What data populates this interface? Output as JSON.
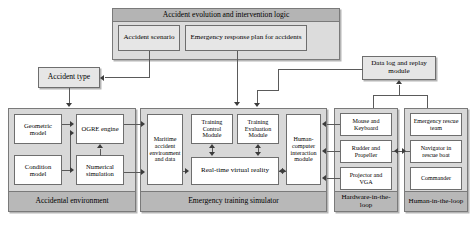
{
  "diagram": {
    "type": "block-diagram",
    "top_container": {
      "header_label": "Accident evolution and intervention logic",
      "children": [
        {
          "label": "Accident scenario"
        },
        {
          "label": "Emergency response plan for accidents"
        }
      ]
    },
    "standalone_nodes": [
      {
        "label": "Accident type"
      },
      {
        "label": "Data log and replay module"
      }
    ],
    "groups": [
      {
        "footer_label": "Accidental environment",
        "nodes": [
          {
            "label": "Geometric model"
          },
          {
            "label": "OGRE engine"
          },
          {
            "label": "Condition model"
          },
          {
            "label": "Numerical simulation"
          }
        ]
      },
      {
        "footer_label": "Emergency training simulator",
        "nodes": [
          {
            "label": "Maritime accident environment and data"
          },
          {
            "label": "Training Control Module"
          },
          {
            "label": "Training Evaluation Module"
          },
          {
            "label": "Real-time virtual reality"
          },
          {
            "label": "Human-computer interaction module"
          }
        ]
      },
      {
        "footer_label": "Hardware-in-the-loop",
        "nodes": [
          {
            "label": "Mouse and Keyboard"
          },
          {
            "label": "Rudder and Propeller"
          },
          {
            "label": "Projector and VGA"
          }
        ]
      },
      {
        "footer_label": "Human-in-the-loop",
        "nodes": [
          {
            "label": "Emergency rescue team"
          },
          {
            "label": "Navigator in rescue boat"
          },
          {
            "label": "Commander"
          }
        ]
      }
    ],
    "colors": {
      "group_fill": "#d8d8d8",
      "header_fill": "#b4b4b4",
      "footer_fill": "#b8b8b8",
      "node_fill": "#e6e6e6",
      "inner_node_fill": "#ffffff",
      "line": "#5a5a5a",
      "border": "#6e6e6e",
      "text": "#000000"
    }
  }
}
